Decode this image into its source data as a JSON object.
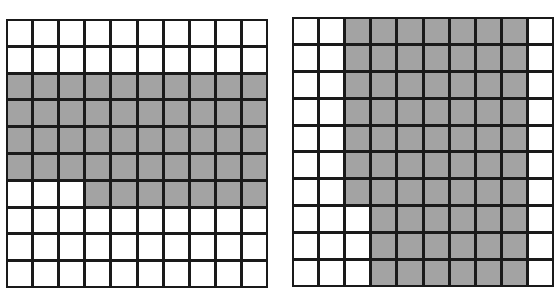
{
  "colors": {
    "shaded": "#a3a3a3",
    "unshaded": "#ffffff",
    "gridline": "#1a1a1a"
  },
  "grids": [
    {
      "id": "left",
      "rows": 10,
      "cols": 10,
      "shaded_count": 47,
      "cells": [
        [
          0,
          0,
          0,
          0,
          0,
          0,
          0,
          0,
          0,
          0
        ],
        [
          0,
          0,
          0,
          0,
          0,
          0,
          0,
          0,
          0,
          0
        ],
        [
          1,
          1,
          1,
          1,
          1,
          1,
          1,
          1,
          1,
          1
        ],
        [
          1,
          1,
          1,
          1,
          1,
          1,
          1,
          1,
          1,
          1
        ],
        [
          1,
          1,
          1,
          1,
          1,
          1,
          1,
          1,
          1,
          1
        ],
        [
          1,
          1,
          1,
          1,
          1,
          1,
          1,
          1,
          1,
          1
        ],
        [
          0,
          0,
          0,
          1,
          1,
          1,
          1,
          1,
          1,
          1
        ],
        [
          0,
          0,
          0,
          0,
          0,
          0,
          0,
          0,
          0,
          0
        ],
        [
          0,
          0,
          0,
          0,
          0,
          0,
          0,
          0,
          0,
          0
        ],
        [
          0,
          0,
          0,
          0,
          0,
          0,
          0,
          0,
          0,
          0
        ]
      ]
    },
    {
      "id": "right",
      "rows": 10,
      "cols": 10,
      "shaded_count": 67,
      "cells": [
        [
          0,
          0,
          1,
          1,
          1,
          1,
          1,
          1,
          1,
          0
        ],
        [
          0,
          0,
          1,
          1,
          1,
          1,
          1,
          1,
          1,
          0
        ],
        [
          0,
          0,
          1,
          1,
          1,
          1,
          1,
          1,
          1,
          0
        ],
        [
          0,
          0,
          1,
          1,
          1,
          1,
          1,
          1,
          1,
          0
        ],
        [
          0,
          0,
          1,
          1,
          1,
          1,
          1,
          1,
          1,
          0
        ],
        [
          0,
          0,
          1,
          1,
          1,
          1,
          1,
          1,
          1,
          0
        ],
        [
          0,
          0,
          1,
          1,
          1,
          1,
          1,
          1,
          1,
          0
        ],
        [
          0,
          0,
          0,
          1,
          1,
          1,
          1,
          1,
          1,
          0
        ],
        [
          0,
          0,
          0,
          1,
          1,
          1,
          1,
          1,
          1,
          0
        ],
        [
          0,
          0,
          0,
          1,
          1,
          1,
          1,
          1,
          1,
          0
        ]
      ]
    }
  ]
}
